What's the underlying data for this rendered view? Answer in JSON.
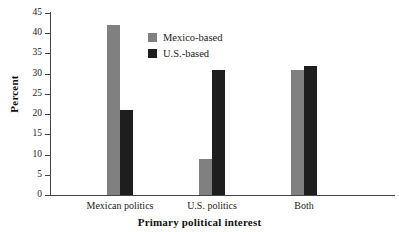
{
  "chart_data": {
    "type": "bar",
    "title": "",
    "xlabel": "Primary political interest",
    "ylabel": "Percent",
    "categories": [
      "Mexican politics",
      "U.S. politics",
      "Both"
    ],
    "series": [
      {
        "name": "Mexico-based",
        "color": "#808080",
        "values": [
          42,
          9,
          31
        ]
      },
      {
        "name": "U.S.-based",
        "color": "#1e1e1e",
        "values": [
          21,
          31,
          32
        ]
      }
    ],
    "ylim": [
      0,
      45
    ],
    "ytick_step": 5,
    "yticks": [
      "45",
      "40",
      "35",
      "30",
      "25",
      "20",
      "15",
      "10",
      "5",
      "0"
    ],
    "grid": false,
    "legend_position": "upper-center-left",
    "axis_color": "#444444",
    "background": "#ffffff"
  },
  "legend": {
    "items": [
      {
        "label": "Mexico-based",
        "swatch": "mexico-based-swatch"
      },
      {
        "label": "U.S.-based",
        "swatch": "us-based-swatch"
      }
    ]
  },
  "axes": {
    "y_title": "Percent",
    "x_title": "Primary political interest"
  }
}
